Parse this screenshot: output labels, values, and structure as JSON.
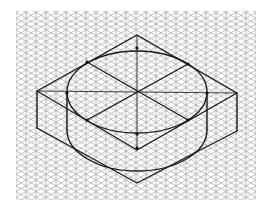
{
  "figure": {
    "grid": {
      "x0": 16,
      "y0": 11,
      "x1": 256,
      "y1": 200,
      "spacing": 10,
      "color": "#9a9a9a"
    },
    "ink_color": "#1a1a1a",
    "top_rhombus": [
      [
        137,
        35
      ],
      [
        237,
        93
      ],
      [
        137,
        150
      ],
      [
        37,
        91
      ]
    ],
    "bottom_rhombus": [
      [
        137,
        75
      ],
      [
        237,
        131
      ],
      [
        137,
        183
      ],
      [
        37,
        128
      ]
    ],
    "top_ellipse": {
      "cx": 137,
      "cy": 92,
      "rx": 70,
      "ry": 41
    },
    "bottom_ellipse": {
      "cx": 137,
      "cy": 130,
      "rx": 70,
      "ry": 41
    },
    "center_axes": {
      "horizontal": [
        [
          37,
          91
        ],
        [
          237,
          93
        ]
      ],
      "vertical": [
        [
          137,
          35
        ],
        [
          137,
          150
        ]
      ]
    },
    "tangent_points": [
      [
        137,
        48
      ],
      [
        87,
        62
      ],
      [
        188,
        64
      ],
      [
        67,
        93
      ],
      [
        207,
        93
      ],
      [
        87,
        120
      ],
      [
        188,
        120
      ],
      [
        137,
        134
      ],
      [
        137,
        148
      ]
    ]
  }
}
